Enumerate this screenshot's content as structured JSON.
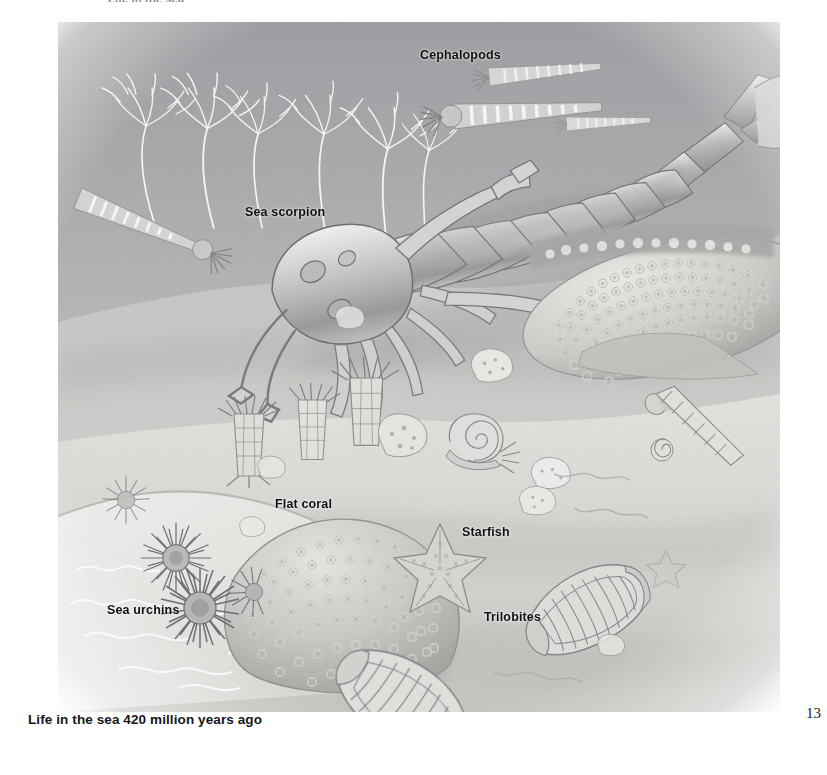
{
  "page": {
    "folio": "13",
    "caption": "Life in the sea 420 million years ago",
    "clipped_heading": "Life in the sea",
    "background_color": "#ffffff",
    "text_color": "#111114"
  },
  "illustration": {
    "title": "Life in the sea 420 million years ago",
    "medium": "airbrush / pencil scientific illustration, greyscale",
    "scene": "Silurian seafloor diorama",
    "palette": {
      "water_deep": "#a8a9ab",
      "water_mid": "#bcbdbf",
      "seafloor_light": "#dedfdc",
      "seafloor_mid": "#c9cac6",
      "sand_highlight": "#ececea",
      "shadow": "#96979a",
      "ink": "#6e7073",
      "highlight_white": "#f7f7f5"
    },
    "labels": [
      {
        "id": "cephalopods",
        "text": "Cephalopods",
        "x": 420,
        "y": 48
      },
      {
        "id": "sea-scorpion",
        "text": "Sea scorpion",
        "x": 245,
        "y": 205
      },
      {
        "id": "flat-coral",
        "text": "Flat coral",
        "x": 275,
        "y": 497
      },
      {
        "id": "starfish",
        "text": "Starfish",
        "x": 462,
        "y": 525
      },
      {
        "id": "sea-urchins",
        "text": "Sea urchins",
        "x": 107,
        "y": 603
      },
      {
        "id": "trilobites",
        "text": "Trilobites",
        "x": 484,
        "y": 610
      }
    ],
    "organisms": [
      {
        "name": "Sea scorpion (eurypterid)",
        "count": 1,
        "description": "large segmented arthropod, 12 tergites, paddle tail fan, walking legs and chelicerae, centre of scene"
      },
      {
        "name": "Cephalopods (orthocone nautiloids)",
        "count": 4,
        "description": "straight conical striped shells with tentacle crowns, three upper right, one mid left"
      },
      {
        "name": "Crinoids (sea lilies)",
        "count": 6,
        "description": "white feathery branching arms on slender stalks, upper left"
      },
      {
        "name": "Flat coral colony",
        "count": 1,
        "description": "dome of closely packed ring corallites, lower left on rock ledge"
      },
      {
        "name": "Tabulate coral reef mass",
        "count": 1,
        "description": "large ring-pitted coral body, right side mid-height"
      },
      {
        "name": "Sea urchins",
        "count": 4,
        "description": "spherical spiny tests with radiating spines, lower left ledge"
      },
      {
        "name": "Starfish",
        "count": 2,
        "description": "five-armed, one large centre, one small faint at right"
      },
      {
        "name": "Trilobites",
        "count": 2,
        "description": "segmented oval exoskeletons with ribbed pleurae, lower centre-right"
      },
      {
        "name": "Gastropod (snail)",
        "count": 2,
        "description": "flat coiled spiral shell with foot and tentacles, centre; small coil at right"
      },
      {
        "name": "Rugose / cup corals",
        "count": 3,
        "description": "ribbed cylindrical cups with tentacle fringes, centre left"
      },
      {
        "name": "Screw shell (turreted gastropod)",
        "count": 1,
        "description": "elongate helical shell, right of centre"
      },
      {
        "name": "Sponges and shell debris",
        "count": 8,
        "description": "pale lumpy nodules scattered over the sand"
      }
    ]
  }
}
